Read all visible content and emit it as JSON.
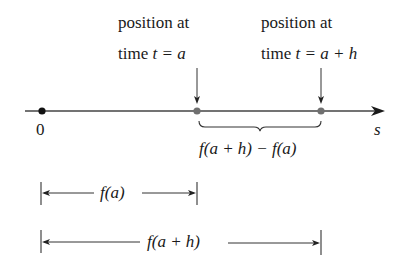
{
  "diagram": {
    "type": "number-line-displacement",
    "colors": {
      "ink": "#1a1a1a",
      "point": "#707070",
      "axis": "#444444"
    },
    "labels": {
      "left_top_line1": "position at",
      "left_top_line2_prefix": "time ",
      "left_top_line2_math": "t = a",
      "right_top_line1": "position at",
      "right_top_line2_prefix": "time ",
      "right_top_line2_math": "t = a + h",
      "origin": "0",
      "axis_variable": "s",
      "difference": "f(a + h) − f(a)",
      "fa": "f(a)",
      "fah": "f(a + h)"
    },
    "points": [
      {
        "name": "origin",
        "label": "0"
      },
      {
        "name": "a",
        "label": "position at time t = a"
      },
      {
        "name": "a+h",
        "label": "position at time t = a + h"
      }
    ]
  }
}
